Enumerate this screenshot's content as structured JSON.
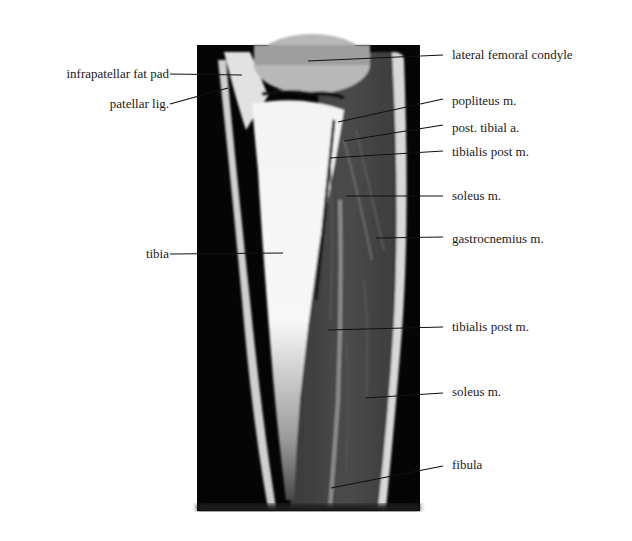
{
  "figure": {
    "type": "MRI sagittal section of the knee and lower leg",
    "image_region": {
      "x": 197,
      "y": 45,
      "width": 223,
      "height": 466
    },
    "left_labels": [
      {
        "text": "infrapatellar  fat pad",
        "x": 164,
        "y": 73,
        "line_to": [
          242,
          75
        ]
      },
      {
        "text": "patellar  lig.",
        "x": 164,
        "y": 102,
        "line_to": [
          228,
          88
        ]
      },
      {
        "text": "tibia",
        "x": 164,
        "y": 254,
        "line_to": [
          283,
          253
        ]
      }
    ],
    "right_labels": [
      {
        "text": "lateral femoral condyle",
        "x": 452,
        "y": 54,
        "line_to": [
          308,
          61
        ]
      },
      {
        "text": "popliteus  m.",
        "x": 452,
        "y": 100,
        "line_to": [
          338,
          122
        ]
      },
      {
        "text": "post. tibial  a.",
        "x": 452,
        "y": 127,
        "line_to": [
          344,
          141
        ]
      },
      {
        "text": "tibialis  post m.",
        "x": 452,
        "y": 151,
        "line_to": [
          330,
          158
        ]
      },
      {
        "text": "soleus  m.",
        "x": 452,
        "y": 195,
        "line_to": [
          346,
          196
        ]
      },
      {
        "text": "gastrocnemius  m.",
        "x": 452,
        "y": 238,
        "line_to": [
          376,
          238
        ]
      },
      {
        "text": "tibialis  post m.",
        "x": 452,
        "y": 326,
        "line_to": [
          328,
          330
        ]
      },
      {
        "text": "soleus  m.",
        "x": 452,
        "y": 391,
        "line_to": [
          365,
          398
        ]
      },
      {
        "text": "fibula",
        "x": 452,
        "y": 464,
        "line_to": [
          331,
          488
        ]
      }
    ]
  },
  "colors": {
    "background": "#ffffff",
    "text": "#1a1a1a",
    "leader": "#111111",
    "mri_bg": "#050505"
  }
}
